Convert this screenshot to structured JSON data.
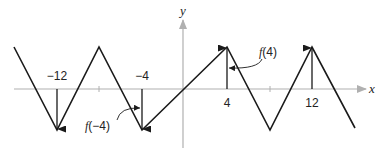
{
  "diagram": {
    "axes": {
      "x_label": "x",
      "y_label": "y",
      "axis_color": "#b0b0b0"
    },
    "curve_color": "#1a1a1a",
    "tick_labels": {
      "t_neg12": "−12",
      "t_neg4": "−4",
      "t_4": "4",
      "t_12": "12"
    },
    "annotations": {
      "f_neg4": {
        "fn": "f",
        "arg": "(−4)"
      },
      "f_4": {
        "fn": "f",
        "arg": "(4)"
      }
    }
  }
}
